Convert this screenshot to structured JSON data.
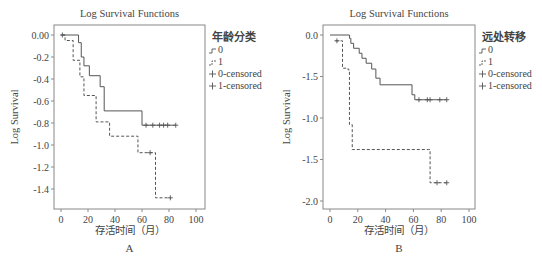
{
  "chart_data": [
    {
      "type": "line",
      "panel_label": "A",
      "title": "Log Survival Functions",
      "xlabel": "存活时间（月）",
      "ylabel": "Log Survival",
      "xlim": [
        0,
        100
      ],
      "ylim": [
        -1.55,
        0.05
      ],
      "x_ticks": [
        "0",
        "20",
        "40",
        "60",
        "80",
        "100"
      ],
      "y_ticks": [
        "0.00",
        "-0.2",
        "-0.4",
        "-0.6",
        "-0.8",
        "-1.0",
        "-1.2",
        "-1.4"
      ],
      "legend": {
        "title": "年龄分类",
        "position": "right",
        "entries": [
          "0",
          "1",
          "0-censored",
          "1-censored"
        ]
      },
      "grid": false,
      "series": [
        {
          "name": "0",
          "style": "solid",
          "steps": [
            [
              0,
              0.0
            ],
            [
              13,
              -0.07
            ],
            [
              15,
              -0.2
            ],
            [
              17,
              -0.28
            ],
            [
              21,
              -0.37
            ],
            [
              29,
              -0.47
            ],
            [
              32,
              -0.69
            ],
            [
              60,
              -0.82
            ],
            [
              85,
              -0.82
            ]
          ],
          "censored": [
            [
              1,
              0.0
            ],
            [
              63,
              -0.82
            ],
            [
              68,
              -0.82
            ],
            [
              73,
              -0.82
            ],
            [
              76,
              -0.82
            ],
            [
              79,
              -0.82
            ],
            [
              85,
              -0.82
            ]
          ]
        },
        {
          "name": "1",
          "style": "dashed",
          "steps": [
            [
              1,
              0.0
            ],
            [
              3,
              -0.05
            ],
            [
              9,
              -0.23
            ],
            [
              14,
              -0.38
            ],
            [
              17,
              -0.55
            ],
            [
              26,
              -0.79
            ],
            [
              36,
              -0.92
            ],
            [
              57,
              -1.07
            ],
            [
              70,
              -1.48
            ],
            [
              81,
              -1.48
            ]
          ],
          "censored": [
            [
              66,
              -1.07
            ],
            [
              81,
              -1.48
            ]
          ]
        }
      ]
    },
    {
      "type": "line",
      "panel_label": "B",
      "title": "Log Survival Functions",
      "xlabel": "存活时间（月）",
      "ylabel": "Log Survival",
      "xlim": [
        0,
        100
      ],
      "ylim": [
        -2.1,
        0.1
      ],
      "x_ticks": [
        "0",
        "20",
        "40",
        "60",
        "80",
        "100"
      ],
      "y_ticks": [
        "0.0",
        "-1.5",
        "-1.0",
        "-1.5",
        "-2.0"
      ],
      "y_tick_values": [
        0.0,
        -0.5,
        -1.0,
        -1.5,
        -2.0
      ],
      "legend": {
        "title": "远处转移",
        "position": "right",
        "entries": [
          "0",
          "1",
          "0-censored",
          "1-censored"
        ]
      },
      "grid": false,
      "series": [
        {
          "name": "0",
          "style": "solid",
          "steps": [
            [
              0,
              0.0
            ],
            [
              14,
              -0.04
            ],
            [
              15,
              -0.1
            ],
            [
              17,
              -0.16
            ],
            [
              21,
              -0.22
            ],
            [
              23,
              -0.28
            ],
            [
              26,
              -0.34
            ],
            [
              30,
              -0.41
            ],
            [
              33,
              -0.52
            ],
            [
              36,
              -0.6
            ],
            [
              59,
              -0.72
            ],
            [
              61,
              -0.78
            ],
            [
              84,
              -0.78
            ]
          ],
          "censored": [
            [
              64,
              -0.78
            ],
            [
              70,
              -0.78
            ],
            [
              72,
              -0.78
            ],
            [
              79,
              -0.78
            ],
            [
              84,
              -0.78
            ]
          ]
        },
        {
          "name": "1",
          "style": "dashed",
          "steps": [
            [
              4,
              -0.07
            ],
            [
              8,
              -0.07
            ],
            [
              9,
              -0.4
            ],
            [
              13,
              -0.42
            ],
            [
              14,
              -1.08
            ],
            [
              16,
              -1.38
            ],
            [
              71,
              -1.38
            ],
            [
              72,
              -1.78
            ],
            [
              84,
              -1.78
            ]
          ],
          "censored": [
            [
              5,
              -0.07
            ],
            [
              77,
              -1.78
            ],
            [
              84,
              -1.78
            ]
          ]
        }
      ]
    }
  ]
}
